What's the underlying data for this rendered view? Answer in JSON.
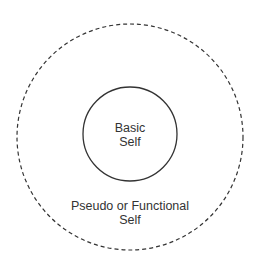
{
  "diagram": {
    "inner_circle": {
      "label_line1": "Basic",
      "label_line2": "Self",
      "stroke": "#333333",
      "style": "solid"
    },
    "outer_circle": {
      "label_line1": "Pseudo or Functional",
      "label_line2": "Self",
      "stroke": "#333333",
      "style": "dashed"
    }
  }
}
